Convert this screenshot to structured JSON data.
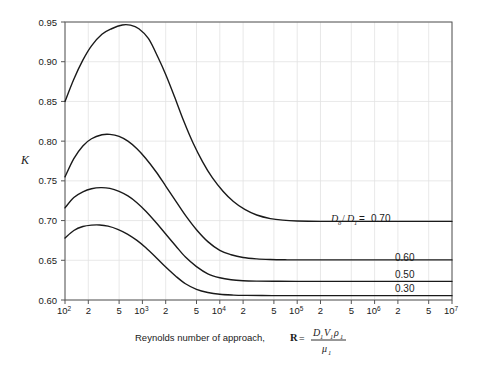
{
  "chart_data": {
    "type": "line",
    "title": "",
    "xlabel": "Reynolds number of approach, R = D₁V₁ρ₁ / μ₁",
    "ylabel": "K",
    "xscale": "log",
    "xlim": [
      100,
      10000000
    ],
    "ylim": [
      0.6,
      0.95
    ],
    "grid": true,
    "legend_position": "inline-right",
    "x_tick_labels": [
      {
        "value": 100,
        "text": "10",
        "exp": "2"
      },
      {
        "value": 200,
        "text": "2",
        "exp": ""
      },
      {
        "value": 500,
        "text": "5",
        "exp": ""
      },
      {
        "value": 1000,
        "text": "10",
        "exp": "3"
      },
      {
        "value": 2000,
        "text": "2",
        "exp": ""
      },
      {
        "value": 5000,
        "text": "5",
        "exp": ""
      },
      {
        "value": 10000,
        "text": "10",
        "exp": "4"
      },
      {
        "value": 20000,
        "text": "2",
        "exp": ""
      },
      {
        "value": 50000,
        "text": "5",
        "exp": ""
      },
      {
        "value": 100000,
        "text": "10",
        "exp": "5"
      },
      {
        "value": 200000,
        "text": "2",
        "exp": ""
      },
      {
        "value": 500000,
        "text": "5",
        "exp": ""
      },
      {
        "value": 1000000,
        "text": "10",
        "exp": "6"
      },
      {
        "value": 2000000,
        "text": "2",
        "exp": ""
      },
      {
        "value": 5000000,
        "text": "5",
        "exp": ""
      },
      {
        "value": 10000000,
        "text": "10",
        "exp": "7"
      }
    ],
    "y_tick_labels": [
      "0.95",
      "0.90",
      "0.85",
      "0.80",
      "0.75",
      "0.70",
      "0.65",
      "0.60"
    ],
    "y_tick_values": [
      0.95,
      0.9,
      0.85,
      0.8,
      0.75,
      0.7,
      0.65,
      0.6
    ],
    "series": [
      {
        "name": "0.70",
        "label": "D₀/D₁ = 0.70",
        "plateau": 0.699,
        "peak": {
          "x": 600,
          "y": 0.9465
        },
        "start": {
          "x": 100,
          "y": 0.85
        },
        "points": [
          [
            100,
            0.85
          ],
          [
            130,
            0.878
          ],
          [
            170,
            0.902
          ],
          [
            220,
            0.92
          ],
          [
            300,
            0.9345
          ],
          [
            400,
            0.9415
          ],
          [
            550,
            0.9462
          ],
          [
            700,
            0.946
          ],
          [
            900,
            0.9415
          ],
          [
            1200,
            0.929
          ],
          [
            1600,
            0.905
          ],
          [
            2000,
            0.884
          ],
          [
            2600,
            0.856
          ],
          [
            3400,
            0.826
          ],
          [
            4500,
            0.798
          ],
          [
            6000,
            0.774
          ],
          [
            8000,
            0.754
          ],
          [
            11000,
            0.737
          ],
          [
            15000,
            0.724
          ],
          [
            21000,
            0.714
          ],
          [
            30000,
            0.707
          ],
          [
            45000,
            0.7025
          ],
          [
            65000,
            0.7005
          ],
          [
            100000,
            0.6995
          ],
          [
            200000,
            0.699
          ],
          [
            1000000,
            0.699
          ],
          [
            10000000,
            0.699
          ]
        ]
      },
      {
        "name": "0.60",
        "label": "0.60",
        "plateau": 0.6505,
        "peak": {
          "x": 330,
          "y": 0.8085
        },
        "start": {
          "x": 100,
          "y": 0.755
        },
        "points": [
          [
            100,
            0.755
          ],
          [
            130,
            0.778
          ],
          [
            170,
            0.794
          ],
          [
            220,
            0.803
          ],
          [
            300,
            0.808
          ],
          [
            380,
            0.8085
          ],
          [
            500,
            0.806
          ],
          [
            650,
            0.8
          ],
          [
            850,
            0.7905
          ],
          [
            1100,
            0.7785
          ],
          [
            1500,
            0.7615
          ],
          [
            2000,
            0.7435
          ],
          [
            2700,
            0.7245
          ],
          [
            3600,
            0.7065
          ],
          [
            5000,
            0.6885
          ],
          [
            7000,
            0.6735
          ],
          [
            10000,
            0.6625
          ],
          [
            14000,
            0.657
          ],
          [
            20000,
            0.6535
          ],
          [
            30000,
            0.6518
          ],
          [
            45000,
            0.651
          ],
          [
            70000,
            0.6506
          ],
          [
            100000,
            0.6505
          ],
          [
            1000000,
            0.6505
          ],
          [
            10000000,
            0.6505
          ]
        ]
      },
      {
        "name": "0.50",
        "label": "0.50",
        "plateau": 0.6235,
        "peak": {
          "x": 300,
          "y": 0.7415
        },
        "start": {
          "x": 100,
          "y": 0.716
        },
        "points": [
          [
            100,
            0.716
          ],
          [
            130,
            0.729
          ],
          [
            170,
            0.736
          ],
          [
            220,
            0.74
          ],
          [
            290,
            0.7415
          ],
          [
            380,
            0.7405
          ],
          [
            500,
            0.7368
          ],
          [
            650,
            0.731
          ],
          [
            850,
            0.7225
          ],
          [
            1100,
            0.712
          ],
          [
            1500,
            0.6975
          ],
          [
            2000,
            0.683
          ],
          [
            2700,
            0.668
          ],
          [
            3600,
            0.654
          ],
          [
            5000,
            0.642
          ],
          [
            7000,
            0.633
          ],
          [
            10000,
            0.628
          ],
          [
            14000,
            0.6255
          ],
          [
            20000,
            0.6243
          ],
          [
            30000,
            0.6238
          ],
          [
            50000,
            0.6236
          ],
          [
            100000,
            0.6235
          ],
          [
            1000000,
            0.6235
          ],
          [
            10000000,
            0.6235
          ]
        ]
      },
      {
        "name": "0.30",
        "label": "0.30",
        "plateau": 0.6055,
        "peak": {
          "x": 250,
          "y": 0.6945
        },
        "start": {
          "x": 100,
          "y": 0.678
        },
        "points": [
          [
            100,
            0.678
          ],
          [
            130,
            0.6875
          ],
          [
            170,
            0.6925
          ],
          [
            220,
            0.6943
          ],
          [
            280,
            0.6945
          ],
          [
            360,
            0.693
          ],
          [
            480,
            0.689
          ],
          [
            640,
            0.683
          ],
          [
            850,
            0.675
          ],
          [
            1100,
            0.666
          ],
          [
            1500,
            0.6535
          ],
          [
            2000,
            0.6415
          ],
          [
            2700,
            0.63
          ],
          [
            3600,
            0.6205
          ],
          [
            5000,
            0.6135
          ],
          [
            7000,
            0.6095
          ],
          [
            10000,
            0.6072
          ],
          [
            15000,
            0.6062
          ],
          [
            22000,
            0.6058
          ],
          [
            35000,
            0.6056
          ],
          [
            60000,
            0.6055
          ],
          [
            100000,
            0.6055
          ],
          [
            1000000,
            0.6055
          ],
          [
            10000000,
            0.6055
          ]
        ]
      }
    ],
    "annotations": [
      {
        "id": "label-070",
        "text": "D₀/D₁ = 0.70",
        "x_px": 363,
        "y_px": 219
      },
      {
        "id": "label-060",
        "text": "0.60",
        "x_px": 409,
        "y_px": 258
      },
      {
        "id": "label-050",
        "text": "0.50",
        "x_px": 409,
        "y_px": 275
      },
      {
        "id": "label-030",
        "text": "0.30",
        "x_px": 409,
        "y_px": 289
      }
    ],
    "colors": {
      "background": "#ffffff",
      "curve": "#1a1a1a",
      "grid": "#e2e2e2",
      "axis": "#555555",
      "text": "#1a1a1a"
    }
  },
  "axis_caption": {
    "prefix": "Reynolds number of approach, ",
    "symbol": "R",
    "equals": " = ",
    "numerator_d": "D",
    "numerator_d_sub": "1",
    "numerator_v": "V",
    "numerator_v_sub": "1",
    "numerator_rho": "ρ",
    "numerator_rho_sub": "1",
    "denominator_mu": "μ",
    "denominator_mu_sub": "1"
  },
  "y_axis_caption": {
    "symbol": "K"
  },
  "ratio_label": {
    "d_numerator": "D",
    "d_numerator_sub": "o",
    "slash": "/",
    "d_denominator": "D",
    "d_denominator_sub": "1",
    "equals": " = ",
    "value": "0.70"
  }
}
